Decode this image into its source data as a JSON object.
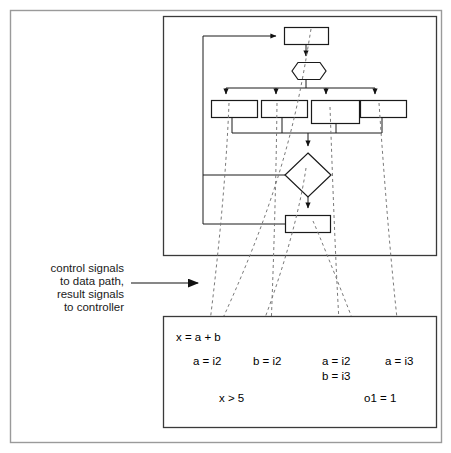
{
  "figure": {
    "outer_frame": {
      "x": 10,
      "y": 10,
      "width": 432,
      "height": 433
    },
    "colors": {
      "background": "#ffffff",
      "outer_frame_stroke": "#9a9a9a",
      "panel_stroke": "#3a3a3a",
      "node_stroke": "#1a1a1a",
      "dashed_stroke": "#7a7a7a",
      "text": "#000000"
    }
  },
  "caption": {
    "lines": [
      "control signals",
      "to data path,",
      "result signals",
      "to controller"
    ],
    "arrow": {
      "x1": 128,
      "y1": 281,
      "x2": 210,
      "y2": 281
    }
  },
  "controller_panel": {
    "name": "controller-fsm-panel",
    "x": 163,
    "y": 16,
    "width": 274,
    "height": 240,
    "nodes": [
      {
        "id": "state-top",
        "type": "rect",
        "x": 284,
        "y": 27,
        "width": 44,
        "height": 17,
        "label": ""
      },
      {
        "id": "decision-hex",
        "type": "hexagon",
        "cx": 306,
        "cy": 71,
        "width": 40,
        "height": 17,
        "label": ""
      },
      {
        "id": "action-1",
        "type": "rect",
        "x": 211,
        "y": 100,
        "width": 46,
        "height": 17,
        "label": ""
      },
      {
        "id": "action-2",
        "type": "rect",
        "x": 262,
        "y": 100,
        "width": 46,
        "height": 17,
        "label": ""
      },
      {
        "id": "action-3",
        "type": "rect",
        "x": 312,
        "y": 100,
        "width": 46,
        "height": 23,
        "label": ""
      },
      {
        "id": "action-4",
        "type": "rect",
        "x": 359,
        "y": 100,
        "width": 46,
        "height": 17,
        "label": ""
      },
      {
        "id": "condition-diamond",
        "type": "diamond",
        "cx": 308,
        "cy": 175,
        "rx": 24,
        "ry": 21,
        "label": ""
      },
      {
        "id": "state-bottom",
        "type": "rect",
        "x": 286,
        "y": 216,
        "width": 44,
        "height": 17,
        "label": ""
      }
    ]
  },
  "datapath_panel": {
    "name": "datapath-operations-panel",
    "x": 163,
    "y": 316,
    "width": 274,
    "height": 112,
    "expressions": [
      {
        "id": "expr-x-eq-a-plus-b",
        "text": "x = a + b",
        "x": 176,
        "y": 337
      },
      {
        "id": "expr-a-eq-i2-left",
        "text": "a = i2",
        "x": 193,
        "y": 361
      },
      {
        "id": "expr-b-eq-i2",
        "text": "b = i2",
        "x": 253,
        "y": 361
      },
      {
        "id": "expr-a-eq-i2-right",
        "text": "a = i2",
        "x": 323,
        "y": 361
      },
      {
        "id": "expr-b-eq-i3",
        "text": "b = i3",
        "x": 323,
        "y": 376
      },
      {
        "id": "expr-a-eq-i3",
        "text": "a = i3",
        "x": 385,
        "y": 361
      },
      {
        "id": "expr-x-gt-5",
        "text": "x > 5",
        "x": 218,
        "y": 398
      },
      {
        "id": "expr-o1-eq-1",
        "text": "o1 = 1",
        "x": 365,
        "y": 398
      }
    ]
  },
  "flow_edges": [
    {
      "id": "feedback-loop-to-top-state",
      "points": "203,38 203,36 278,36",
      "arrow": "right",
      "tip": "284,36"
    },
    {
      "id": "top-state-to-hex",
      "points": "306,44 306,57",
      "arrow": "down",
      "tip": "306,62"
    },
    {
      "id": "hex-to-fanout-bus",
      "points": "306,80 306,88 226,88 226,94",
      "arrow": "down",
      "tip": "226,99"
    },
    {
      "id": "fanout-bus-branch-2",
      "points": "276,88 276,94",
      "arrow": "down",
      "tip": "276,99"
    },
    {
      "id": "fanout-bus-branch-3",
      "points": "326,88 326,94",
      "arrow": "down",
      "tip": "326,99"
    },
    {
      "id": "fanout-bus-branch-4",
      "points": "375,88 375,94",
      "arrow": "down",
      "tip": "375,99"
    },
    {
      "id": "merge-bus-to-diamond",
      "points": "232,117 232,133 308,133 308,148",
      "arrow": "down",
      "tip": "308,153"
    },
    {
      "id": "diamond-to-bottom-state",
      "points": "308,196 308,209",
      "arrow": "down",
      "tip": "308,214"
    },
    {
      "id": "diamond-left-exit",
      "points": "203,175 284,175",
      "arrow": "none",
      "tip": ""
    },
    {
      "id": "bottom-state-left-exit",
      "points": "203,224 286,224",
      "arrow": "none",
      "tip": ""
    }
  ],
  "dashed_links": [
    {
      "id": "link-x-eq-a-plus-b",
      "from": "state-top",
      "path": "M 310,30 L 288,160 L 215,330"
    },
    {
      "id": "link-a-eq-i2-left",
      "from": "action-1",
      "path": "M 228,104 L 222,210 L 208,352"
    },
    {
      "id": "link-b-eq-i2",
      "from": "action-2",
      "path": "M 277,104 L 274,250 L 270,352"
    },
    {
      "id": "link-x-gt-5",
      "from": "condition-diamond",
      "path": "M 306,170 L 288,250 L 236,390"
    },
    {
      "id": "link-a-eq-i2-b-eq-i3",
      "from": "action-3",
      "path": "M 329,108 L 332,240 L 340,352"
    },
    {
      "id": "link-a-eq-i3",
      "from": "action-4",
      "path": "M 378,104 L 384,240 L 400,352"
    },
    {
      "id": "link-o1-eq-1",
      "from": "state-bottom",
      "path": "M 312,222 L 336,250 L 383,390"
    }
  ]
}
